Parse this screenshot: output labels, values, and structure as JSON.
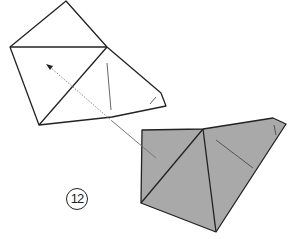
{
  "diagram": {
    "type": "origami-fold-step",
    "step_number": "12",
    "colors": {
      "stroke": "#222222",
      "fill_front": "#ffffff",
      "fill_back": "#a9a9a9",
      "arrow": "#777777",
      "crease": "#555555"
    },
    "shapes": {
      "before": {
        "label": "unfolded view (white side)",
        "outline": [
          [
            66,
            1
          ],
          [
            107,
            47
          ],
          [
            161,
            93
          ],
          [
            166,
            106
          ],
          [
            112,
            117
          ],
          [
            39,
            125
          ],
          [
            10,
            47
          ]
        ]
      },
      "after": {
        "label": "result view (colored side)",
        "outline": [
          [
            142,
            130
          ],
          [
            203,
            129
          ],
          [
            273,
            118
          ],
          [
            286,
            124
          ],
          [
            216,
            232
          ],
          [
            141,
            203
          ]
        ]
      }
    },
    "arrow": {
      "meaning": "move/turn over direction",
      "from": [
        156,
        158
      ],
      "to": [
        46,
        64
      ]
    }
  }
}
